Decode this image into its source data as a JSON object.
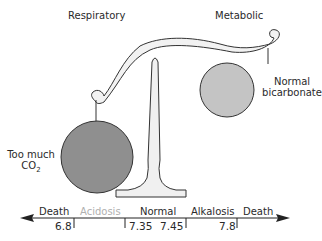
{
  "labels": {
    "respiratory": "Respiratory",
    "metabolic": "Metabolic",
    "left_weight": {
      "line1": "Too much",
      "line2_main": "CO",
      "line2_sub": "2"
    },
    "right_weight": {
      "line1": "Normal",
      "line2": "bicarbonate"
    }
  },
  "scale": {
    "zones": [
      {
        "label": "Death",
        "faded": false
      },
      {
        "label": "Acidosis",
        "faded": true
      },
      {
        "label": "Normal",
        "faded": false
      },
      {
        "label": "Alkalosis",
        "faded": false
      },
      {
        "label": "Death",
        "faded": false
      }
    ],
    "ticks": [
      "6.8",
      "7.35",
      "7.45",
      "7.8"
    ]
  },
  "colors": {
    "left_weight": "#8f8f8f",
    "right_weight": "#c4c4c4",
    "beam_fill": "#f2f2f2",
    "outline": "#333333",
    "faded_text": "#b0b0b0"
  }
}
